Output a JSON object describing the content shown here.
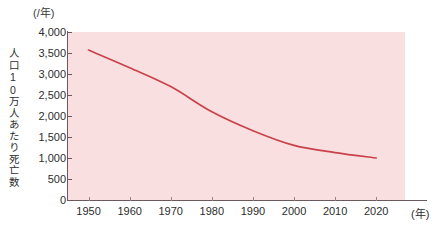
{
  "chart_data": {
    "type": "line",
    "title": "",
    "xlabel": "(年)",
    "ylabel": "人口10万人あたり死亡数",
    "y_unit_caption": "(/年)",
    "x": [
      1950,
      1960,
      1970,
      1980,
      1990,
      2000,
      2010,
      2020
    ],
    "values": [
      3570,
      3150,
      2700,
      2100,
      1650,
      1300,
      1130,
      1000
    ],
    "series": [
      {
        "name": "人口10万人あたり死亡数",
        "values": [
          3570,
          3150,
          2700,
          2100,
          1650,
          1300,
          1130,
          1000
        ]
      }
    ],
    "xlim": [
      1945,
      2027
    ],
    "ylim": [
      0,
      4000
    ],
    "y_ticks": [
      0,
      500,
      1000,
      1500,
      2000,
      2500,
      3000,
      3500,
      4000
    ],
    "y_tick_labels": [
      "0",
      "500",
      "1,000",
      "1,500",
      "2,000",
      "2,500",
      "3,000",
      "3,500",
      "4,000"
    ],
    "x_ticks": [
      1950,
      1960,
      1970,
      1980,
      1990,
      2000,
      2010,
      2020
    ],
    "x_tick_labels": [
      "1950",
      "1960",
      "1970",
      "1980",
      "1990",
      "2000",
      "2010",
      "2020"
    ],
    "grid": false,
    "legend": "none",
    "line_color": "#c8414b",
    "plot_background": "#fadfe0",
    "axis_color": "#6b5a5d",
    "figure_background": "#ffffff"
  }
}
